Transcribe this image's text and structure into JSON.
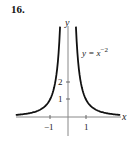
{
  "problem_number": "16.",
  "chart_data": {
    "type": "line",
    "title": "",
    "function_label": "y = x^-2",
    "function_label_base": "y = x",
    "function_label_exp": "−2",
    "xlabel": "x",
    "ylabel": "y",
    "x_ticks": [
      {
        "value": -1,
        "label": "−1"
      },
      {
        "value": 1,
        "label": "1"
      }
    ],
    "y_ticks": [
      {
        "value": 1,
        "label": "1"
      },
      {
        "value": 2,
        "label": "2"
      }
    ],
    "xlim": [
      -2.9,
      3.0
    ],
    "ylim": [
      -1.0,
      5.2
    ],
    "grid": false,
    "series": [
      {
        "name": "y = x^-2 (x<0)",
        "x": [
          -2.9,
          -2.5,
          -2,
          -1.5,
          -1.2,
          -1,
          -0.8,
          -0.7,
          -0.6,
          -0.5,
          -0.44
        ],
        "y": [
          0.119,
          0.16,
          0.25,
          0.444,
          0.694,
          1,
          1.5625,
          2.04,
          2.78,
          4,
          5.17
        ]
      },
      {
        "name": "y = x^-2 (x>0)",
        "x": [
          0.44,
          0.5,
          0.6,
          0.7,
          0.8,
          1,
          1.2,
          1.5,
          2,
          2.5,
          2.9
        ],
        "y": [
          5.17,
          4,
          2.78,
          2.04,
          1.5625,
          1,
          0.694,
          0.444,
          0.25,
          0.16,
          0.119
        ]
      }
    ]
  }
}
